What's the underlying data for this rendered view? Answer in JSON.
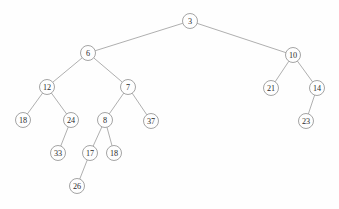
{
  "figure": {
    "type": "binary-tree-diagram",
    "width": 339,
    "height": 209,
    "background_color": "#fefefe",
    "node_fill_color": "#fefefe",
    "node_stroke_color": "#8d8d8d",
    "edge_color": "#9a9a9a",
    "label_color": "#2b2b2b",
    "node_radius": 7.5
  },
  "chart_data": {
    "type": "diagram",
    "title": "",
    "nodes": [
      {
        "id": "n3",
        "label": "3",
        "x": 190,
        "y": 21,
        "depth": 0
      },
      {
        "id": "n6",
        "label": "6",
        "x": 88,
        "y": 53,
        "depth": 1
      },
      {
        "id": "n10",
        "label": "10",
        "x": 293,
        "y": 55,
        "depth": 1
      },
      {
        "id": "n12",
        "label": "12",
        "x": 47,
        "y": 87,
        "depth": 2
      },
      {
        "id": "n7",
        "label": "7",
        "x": 128,
        "y": 87,
        "depth": 2
      },
      {
        "id": "n21",
        "label": "21",
        "x": 271,
        "y": 88,
        "depth": 2
      },
      {
        "id": "n14",
        "label": "14",
        "x": 317,
        "y": 88,
        "depth": 2
      },
      {
        "id": "n18a",
        "label": "18",
        "x": 23,
        "y": 120,
        "depth": 3
      },
      {
        "id": "n24",
        "label": "24",
        "x": 71,
        "y": 120,
        "depth": 3
      },
      {
        "id": "n8",
        "label": "8",
        "x": 105,
        "y": 120,
        "depth": 3
      },
      {
        "id": "n37",
        "label": "37",
        "x": 151,
        "y": 121,
        "depth": 3
      },
      {
        "id": "n23",
        "label": "23",
        "x": 306,
        "y": 121,
        "depth": 3
      },
      {
        "id": "n33",
        "label": "33",
        "x": 58,
        "y": 153,
        "depth": 4
      },
      {
        "id": "n17",
        "label": "17",
        "x": 90,
        "y": 153,
        "depth": 4
      },
      {
        "id": "n18b",
        "label": "18",
        "x": 114,
        "y": 153,
        "depth": 4
      },
      {
        "id": "n26",
        "label": "26",
        "x": 77,
        "y": 186,
        "depth": 5
      }
    ],
    "edges": [
      {
        "from": "n3",
        "to": "n6",
        "side": "left"
      },
      {
        "from": "n3",
        "to": "n10",
        "side": "right"
      },
      {
        "from": "n6",
        "to": "n12",
        "side": "left"
      },
      {
        "from": "n6",
        "to": "n7",
        "side": "right"
      },
      {
        "from": "n10",
        "to": "n21",
        "side": "left"
      },
      {
        "from": "n10",
        "to": "n14",
        "side": "right"
      },
      {
        "from": "n12",
        "to": "n18a",
        "side": "left"
      },
      {
        "from": "n12",
        "to": "n24",
        "side": "right"
      },
      {
        "from": "n7",
        "to": "n8",
        "side": "left"
      },
      {
        "from": "n7",
        "to": "n37",
        "side": "right"
      },
      {
        "from": "n14",
        "to": "n23",
        "side": "left"
      },
      {
        "from": "n24",
        "to": "n33",
        "side": "left"
      },
      {
        "from": "n8",
        "to": "n17",
        "side": "left"
      },
      {
        "from": "n8",
        "to": "n18b",
        "side": "right"
      },
      {
        "from": "n17",
        "to": "n26",
        "side": "left"
      }
    ]
  }
}
